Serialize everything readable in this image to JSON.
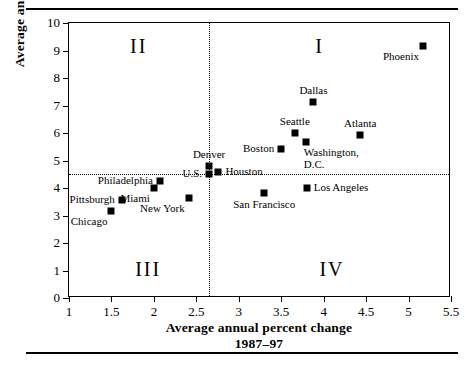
{
  "chart_data": {
    "type": "scatter",
    "title": "",
    "xlabel": "Average annual percent change 1987–97",
    "xlabel_line1": "Average annual percent change",
    "xlabel_line2": "1987–97",
    "ylabel": "Average annual percent change 1977–87",
    "ylabel_line1": "Average annual percent change",
    "ylabel_line2": "1977–87",
    "xlim": [
      1,
      5.5
    ],
    "ylim": [
      0,
      10
    ],
    "xticks": [
      "1",
      "1.5",
      "2",
      "2.5",
      "3",
      "3.5",
      "4",
      "4.5",
      "5",
      "5.5"
    ],
    "xtick_values": [
      1,
      1.5,
      2,
      2.5,
      3,
      3.5,
      4,
      4.5,
      5,
      5.5
    ],
    "yticks": [
      "0",
      "1",
      "2",
      "3",
      "4",
      "5",
      "6",
      "7",
      "8",
      "9",
      "10"
    ],
    "ytick_values": [
      0,
      1,
      2,
      3,
      4,
      5,
      6,
      7,
      8,
      9,
      10
    ],
    "grid": false,
    "reference_lines": {
      "horizontal_value": 4.5,
      "vertical_value": 2.65,
      "style": "dotted"
    },
    "quadrant_labels": [
      {
        "text": "I",
        "x": 3.9,
        "y": 9.1
      },
      {
        "text": "II",
        "x": 1.72,
        "y": 9.1
      },
      {
        "text": "III",
        "x": 1.78,
        "y": 1.0
      },
      {
        "text": "IV",
        "x": 3.95,
        "y": 1.0
      }
    ],
    "points": [
      {
        "name": "Chicago",
        "x": 1.5,
        "y": 3.15,
        "label_pos": "below-left"
      },
      {
        "name": "Pittsburgh",
        "x": 1.62,
        "y": 3.57,
        "label_pos": "left"
      },
      {
        "name": "Miami",
        "x": 2.0,
        "y": 4.0,
        "label_pos": "below-left"
      },
      {
        "name": "Philadelphia",
        "x": 2.07,
        "y": 4.27,
        "label_pos": "left"
      },
      {
        "name": "New York",
        "x": 2.41,
        "y": 3.65,
        "label_pos": "below-left"
      },
      {
        "name": "Denver",
        "x": 2.65,
        "y": 4.79,
        "label_pos": "above"
      },
      {
        "name": "U.S.",
        "x": 2.65,
        "y": 4.5,
        "label_pos": "left"
      },
      {
        "name": "Houston",
        "x": 2.76,
        "y": 4.6,
        "label_pos": "right"
      },
      {
        "name": "San Francisco",
        "x": 3.3,
        "y": 3.81,
        "label_pos": "below"
      },
      {
        "name": "Boston",
        "x": 3.5,
        "y": 5.43,
        "label_pos": "left"
      },
      {
        "name": "Seattle",
        "x": 3.66,
        "y": 6.0,
        "label_pos": "above"
      },
      {
        "name": "Washington, D.C.",
        "x": 3.79,
        "y": 5.66,
        "label_pos": "below-right"
      },
      {
        "name": "Los Angeles",
        "x": 3.8,
        "y": 4.0,
        "label_pos": "right"
      },
      {
        "name": "Dallas",
        "x": 3.88,
        "y": 7.14,
        "label_pos": "above"
      },
      {
        "name": "Atlanta",
        "x": 4.43,
        "y": 5.91,
        "label_pos": "above"
      },
      {
        "name": "Phoenix",
        "x": 5.17,
        "y": 9.15,
        "label_pos": "below-left"
      }
    ],
    "point_labels": {
      "chicago": "Chicago",
      "pittsburgh": "Pittsburgh",
      "miami": "Miami",
      "philadelphia": "Philadelphia",
      "new_york": "New York",
      "denver": "Denver",
      "us": "U.S.",
      "houston": "Houston",
      "san_francisco": "San Francisco",
      "boston": "Boston",
      "seattle": "Seattle",
      "washington_dc_l1": "Washington,",
      "washington_dc_l2": "D.C.",
      "los_angeles": "Los Angeles",
      "dallas": "Dallas",
      "atlanta": "Atlanta",
      "phoenix": "Phoenix"
    }
  }
}
